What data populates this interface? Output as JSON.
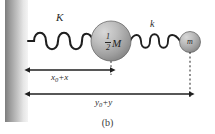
{
  "figure": {
    "caption": "(b)",
    "background_color": "#ffffff",
    "stroke_color": "#1f1f1f"
  },
  "wall": {
    "name": "fixed-wall",
    "gradient_from": "#6f6f6f",
    "gradient_to": "#f2f2f2"
  },
  "springs": [
    {
      "id": "spring-K",
      "label": "K",
      "coils": 5,
      "stiffness_symbol": "K"
    },
    {
      "id": "spring-k",
      "label": "k",
      "coils": 4,
      "stiffness_symbol": "k"
    }
  ],
  "masses": [
    {
      "id": "mass-M",
      "label_numerator": "1",
      "label_denominator": "2",
      "label_symbol": "M",
      "fill_light": "#c9c9c9",
      "fill_dark": "#8a8a8a"
    },
    {
      "id": "mass-m",
      "label_symbol": "m",
      "fill_light": "#c9c9c9",
      "fill_dark": "#8a8a8a"
    }
  ],
  "dimensions": [
    {
      "id": "dimension-x",
      "label_base": "x",
      "label_subscript": "0",
      "label_plus": "+",
      "label_var": "x",
      "label_full": "x0 + x"
    },
    {
      "id": "dimension-y",
      "label_base": "y",
      "label_subscript": "0",
      "label_plus": "+",
      "label_var": "y",
      "label_full": "y0 + y"
    }
  ]
}
